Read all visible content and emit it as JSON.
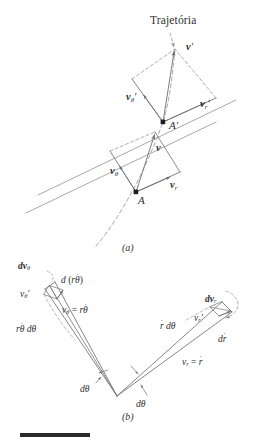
{
  "figure": {
    "title": "Trajetória",
    "panel_a_label": "(a)",
    "panel_b_label": "(b)",
    "background_color": "#ffffff",
    "line_color": "#6f6f6f",
    "text_color": "#2e2e2e",
    "rule_color": "#2a2a2a"
  },
  "panel_a": {
    "name": "(a)",
    "trajectory_label": "Trajetória",
    "points": [
      {
        "id": "A",
        "label": "A"
      },
      {
        "id": "Aprime",
        "label": "A"
      }
    ],
    "vectors": [
      {
        "id": "v-prime",
        "label_main": "v",
        "label_prime": "′",
        "label_sub": ""
      },
      {
        "id": "v-theta-prime",
        "label_main": "v",
        "label_sub": "θ",
        "label_prime": "′"
      },
      {
        "id": "v-r-prime",
        "label_main": "v",
        "label_sub": "r",
        "label_prime": "′"
      },
      {
        "id": "v",
        "label_main": "v",
        "label_sub": "",
        "label_prime": ""
      },
      {
        "id": "v-theta",
        "label_main": "v",
        "label_sub": "θ",
        "label_prime": ""
      },
      {
        "id": "v-r",
        "label_main": "v",
        "label_sub": "r",
        "label_prime": ""
      }
    ]
  },
  "panel_b": {
    "name": "(b)",
    "labels": {
      "dv_theta": {
        "d": "d",
        "v": "v",
        "sub": "θ"
      },
      "d_r_thetadot": {
        "text": "d (rθ̇)"
      },
      "v_theta_prime": {
        "v": "v",
        "sub": "θ",
        "prime": "′"
      },
      "v_theta_eq": {
        "text": "vθ = rθ̇"
      },
      "r_thetadot_dtheta": {
        "text": "rθ̇ dθ"
      },
      "dv_r": {
        "d": "d",
        "v": "v",
        "sub": "r"
      },
      "v_r_prime": {
        "v": "v",
        "sub": "r",
        "prime": "′"
      },
      "rdot_dtheta": {
        "text": "ṙ dθ"
      },
      "d_rdot": {
        "text": "dṙ"
      },
      "v_r_eq": {
        "text": "vr = ṙ"
      },
      "dtheta_left": {
        "text": "dθ"
      },
      "dtheta_right": {
        "text": "dθ"
      }
    }
  }
}
